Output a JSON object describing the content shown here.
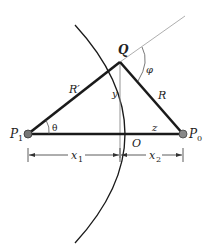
{
  "diagram": {
    "labels": {
      "Q": "Q",
      "phi": "φ",
      "R_prime": "R′",
      "R": "R",
      "y": "y",
      "theta": "θ",
      "P1_main": "P",
      "P1_sub": "1",
      "P0_main": "P",
      "P0_sub": "0",
      "z": "z",
      "O": "O",
      "x1_main": "x",
      "x1_sub": "1",
      "x2_main": "x",
      "x2_sub": "2"
    },
    "colors": {
      "thick_line": "#1a1a1a",
      "thin_line": "#888888",
      "point_fill": "#777777"
    }
  }
}
